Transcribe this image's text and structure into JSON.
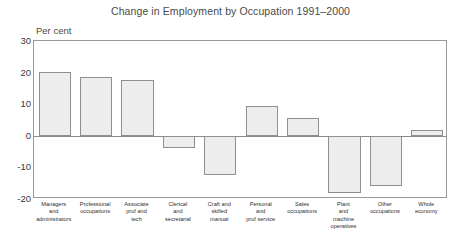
{
  "chart_data": {
    "type": "bar",
    "title": "Change in Employment by Occupation 1991–2000",
    "xlabel": "",
    "ylabel": "Per cent",
    "ylim": [
      -20,
      30
    ],
    "yticks": [
      30,
      20,
      10,
      0,
      -10,
      -20
    ],
    "ytick_labels": [
      "30",
      "20",
      "10",
      "0",
      "-10",
      "-20"
    ],
    "grid": false,
    "legend": null,
    "zero_line": 0,
    "categories": [
      "Managers and administrators",
      "Professional occupations",
      "Associate prof and tech",
      "Clerical and secretarial",
      "Craft and skilled manual",
      "Personal and prof service",
      "Sales occupations",
      "Plant and machine operatives",
      "Other occupations",
      "Whole economy"
    ],
    "values": [
      20.2,
      18.7,
      17.8,
      -4.0,
      -12.5,
      9.5,
      5.5,
      -18.0,
      -16.0,
      1.8
    ],
    "bar_fill_color": "#ededed",
    "bar_border_color": "#8f8f8f"
  },
  "axis": {
    "unit_label": "Per cent"
  },
  "category_lines": [
    [
      "Managers",
      "and",
      "administrators"
    ],
    [
      "Professional",
      "occupations"
    ],
    [
      "Associate",
      "prof and",
      "tech"
    ],
    [
      "Clerical",
      "and",
      "secretarial"
    ],
    [
      "Craft and",
      "skilled",
      "manual"
    ],
    [
      "Personal",
      "and",
      "prof service"
    ],
    [
      "Sales",
      "occupations"
    ],
    [
      "Plant",
      "and",
      "machine",
      "operatives"
    ],
    [
      "Other",
      "occupations"
    ],
    [
      "Whole",
      "economy"
    ]
  ]
}
